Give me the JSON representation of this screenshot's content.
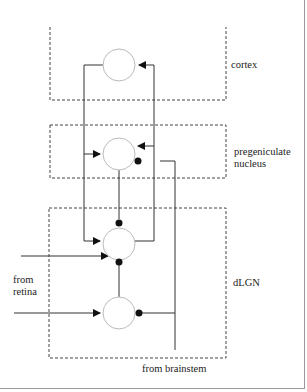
{
  "diagram": {
    "regions": [
      {
        "id": "cortex",
        "label": "cortex"
      },
      {
        "id": "pregeniculate",
        "label": "pregeniculate nucleus",
        "label_lines": [
          "pregeniculate",
          "nucleus"
        ]
      },
      {
        "id": "dlgn",
        "label": "dLGN"
      }
    ],
    "inputs": [
      {
        "id": "retina",
        "label": "from retina",
        "label_lines": [
          "from",
          "retina"
        ]
      },
      {
        "id": "brainstem",
        "label": "from brainstem"
      }
    ],
    "nodes": [
      {
        "id": "cortex-neuron",
        "region": "cortex"
      },
      {
        "id": "pregeniculate-neuron",
        "region": "pregeniculate"
      },
      {
        "id": "relay-neuron",
        "region": "dlgn"
      },
      {
        "id": "interneuron",
        "region": "dlgn"
      }
    ],
    "connections": [
      {
        "from": "relay-neuron",
        "to": "cortex-neuron",
        "type": "excitatory"
      },
      {
        "from": "cortex-neuron",
        "to": "pregeniculate-neuron",
        "type": "excitatory"
      },
      {
        "from": "cortex-neuron",
        "to": "relay-neuron",
        "type": "excitatory"
      },
      {
        "from": "relay-neuron",
        "to": "pregeniculate-neuron",
        "type": "excitatory"
      },
      {
        "from": "pregeniculate-neuron",
        "to": "relay-neuron",
        "type": "inhibitory"
      },
      {
        "from": "interneuron",
        "to": "relay-neuron",
        "type": "inhibitory"
      },
      {
        "from": "retina",
        "to": "relay-neuron",
        "type": "excitatory"
      },
      {
        "from": "retina",
        "to": "interneuron",
        "type": "excitatory"
      },
      {
        "from": "brainstem",
        "to": "pregeniculate-neuron",
        "type": "inhibitory"
      },
      {
        "from": "brainstem",
        "to": "interneuron",
        "type": "inhibitory"
      }
    ]
  },
  "labels": {
    "cortex": "cortex",
    "pregeniculate_1": "pregeniculate",
    "pregeniculate_2": "nucleus",
    "dlgn": "dLGN",
    "retina_1": "from",
    "retina_2": "retina",
    "brainstem": "from brainstem"
  }
}
